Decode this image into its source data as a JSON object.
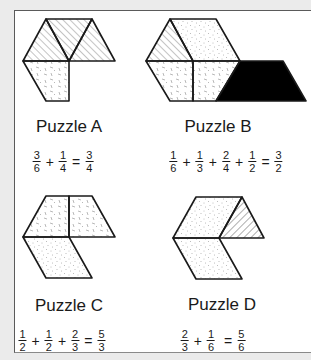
{
  "puzzles": [
    {
      "id": "A",
      "label": "Puzzle A",
      "equation": {
        "terms": [
          {
            "num": "3",
            "den": "6"
          },
          {
            "num": "1",
            "den": "4"
          }
        ],
        "result": {
          "num": "3",
          "den": "4"
        },
        "plus": "+",
        "equals": "="
      }
    },
    {
      "id": "B",
      "label": "Puzzle B",
      "equation": {
        "terms": [
          {
            "num": "1",
            "den": "6"
          },
          {
            "num": "1",
            "den": "3"
          },
          {
            "num": "2",
            "den": "4"
          },
          {
            "num": "1",
            "den": "2"
          }
        ],
        "result": {
          "num": "3",
          "den": "2"
        },
        "plus": "+",
        "equals": "="
      }
    },
    {
      "id": "C",
      "label": "Puzzle C",
      "equation": {
        "terms": [
          {
            "num": "1",
            "den": "2"
          },
          {
            "num": "1",
            "den": "2"
          },
          {
            "num": "2",
            "den": "3"
          }
        ],
        "result": {
          "num": "5",
          "den": "3"
        },
        "plus": "+",
        "equals": "="
      }
    },
    {
      "id": "D",
      "label": "Puzzle D",
      "equation": {
        "terms": [
          {
            "num": "2",
            "den": "3"
          },
          {
            "num": "1",
            "den": "6"
          }
        ],
        "result": {
          "num": "5",
          "den": "6"
        },
        "plus": "+",
        "equals": "="
      }
    }
  ],
  "colors": {
    "outline": "#1a1a1a",
    "solid_fill": "#000000",
    "background": "#ebebeb",
    "panel": "#ffffff"
  },
  "fill_patterns": {
    "hatched": "diagonal-lines",
    "dashed": "short-dash-texture",
    "dotted": "dot-texture",
    "solid": "black"
  }
}
